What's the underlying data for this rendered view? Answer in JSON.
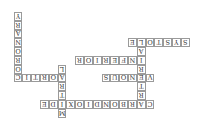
{
  "puzzle": {
    "orientation": "rotated-180",
    "cell_size": 8.8,
    "origin": {
      "x": 13.6,
      "y": 12
    },
    "words": [
      {
        "answer": "CORONARY",
        "direction": "down",
        "col": 0,
        "row": 0
      },
      {
        "answer": "AORTIC",
        "direction": "across",
        "col": 0,
        "row": 7
      },
      {
        "answer": "MITRAL",
        "direction": "down",
        "col": 5,
        "row": 6
      },
      {
        "answer": "CARBONDIOXIDE",
        "direction": "across",
        "col": 3,
        "row": 10
      },
      {
        "answer": "ARTERIAL",
        "direction": "down",
        "col": 14,
        "row": 3
      },
      {
        "answer": "VENOUS",
        "direction": "across",
        "col": 10,
        "row": 7
      },
      {
        "answer": "INFERIOR",
        "direction": "across",
        "col": 7,
        "row": 5
      },
      {
        "answer": "SYSTOLE",
        "direction": "across",
        "col": 13,
        "row": 3
      }
    ]
  }
}
